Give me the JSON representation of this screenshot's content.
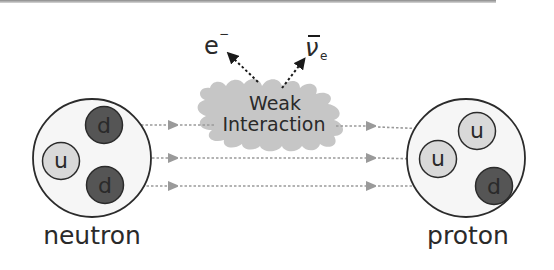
{
  "diagram": {
    "interaction": {
      "line1": "Weak",
      "line2": "Interaction"
    },
    "emitted": {
      "electron": {
        "symbol": "e",
        "superscript": "−"
      },
      "antineutrino": {
        "symbol": "ν",
        "subscript": "e",
        "bar": true
      }
    },
    "neutron": {
      "label": "neutron",
      "quarks": [
        {
          "flavor": "d",
          "color": "#555555"
        },
        {
          "flavor": "u",
          "color": "#d9d9d9"
        },
        {
          "flavor": "d",
          "color": "#555555"
        }
      ]
    },
    "proton": {
      "label": "proton",
      "quarks": [
        {
          "flavor": "u",
          "color": "#d9d9d9"
        },
        {
          "flavor": "u",
          "color": "#d9d9d9"
        },
        {
          "flavor": "d",
          "color": "#555555"
        }
      ]
    },
    "colors": {
      "up_quark": "#d9d9d9",
      "down_quark": "#555555",
      "cloud": "#c4c4c4",
      "arrow": "#9a9a9a",
      "outline": "#2b2b2b",
      "nucleon_fill": "#f6f6f6"
    }
  }
}
